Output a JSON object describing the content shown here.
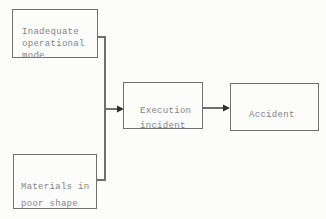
{
  "diagram": {
    "colors": {
      "background": "#fcfcfb",
      "line": "#6f6f6f",
      "text": "#82828a",
      "arrowhead": "#2f2f2f"
    },
    "nodes": [
      {
        "id": "inadequate-operational-mode",
        "label": "Inadequate\noperational\nmode"
      },
      {
        "id": "materials-in-poor-shape",
        "label": "Materials in\npoor shape"
      },
      {
        "id": "execution-incident",
        "label": "Execution\nincident"
      },
      {
        "id": "accident",
        "label": "Accident"
      }
    ],
    "edges": [
      {
        "from": "inadequate-operational-mode",
        "to": "execution-incident",
        "style": "elbow-merge-arrow"
      },
      {
        "from": "materials-in-poor-shape",
        "to": "execution-incident",
        "style": "elbow-merge-arrow"
      },
      {
        "from": "execution-incident",
        "to": "accident",
        "style": "straight-arrow"
      }
    ]
  }
}
